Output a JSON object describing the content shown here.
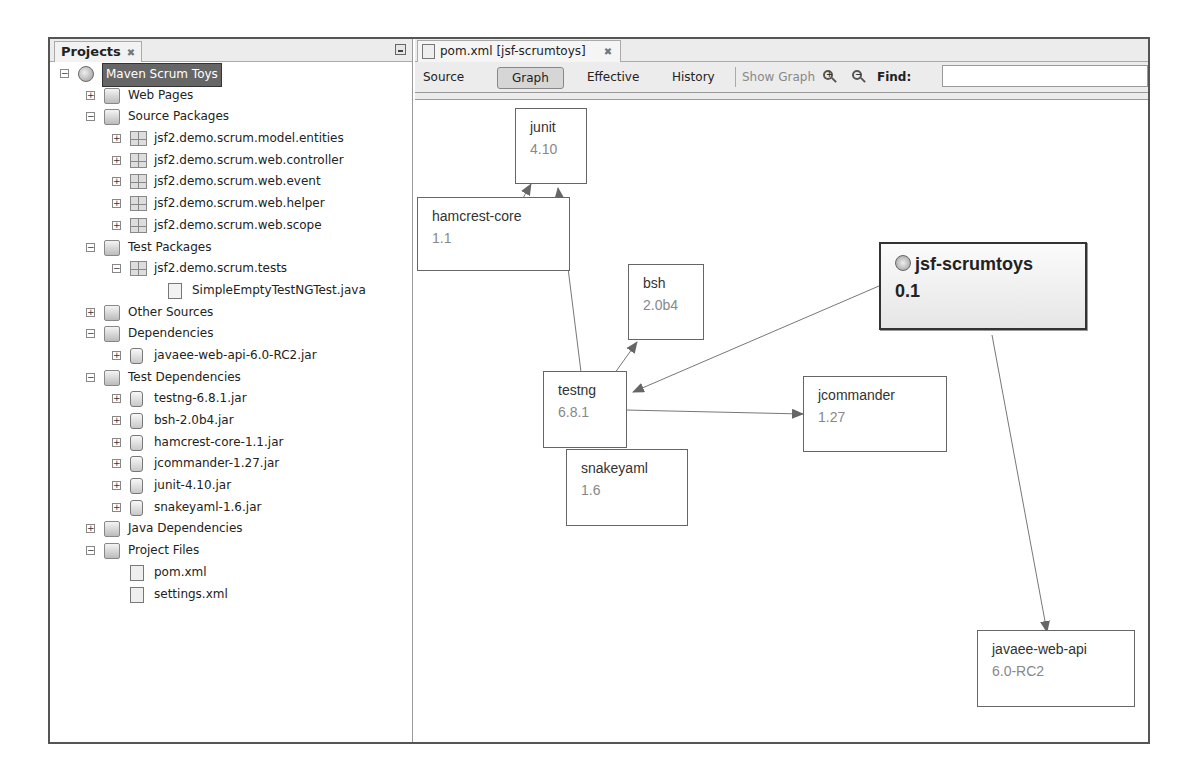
{
  "projects_panel": {
    "title": "Projects",
    "close_glyph": "✖",
    "tree": [
      {
        "label": "Maven Scrum Toys",
        "icon": "maven-project-icon",
        "level": 0,
        "toggle": "minus",
        "selected": true
      },
      {
        "label": "Web Pages",
        "icon": "web-pages-folder-icon",
        "level": 1,
        "toggle": "plus"
      },
      {
        "label": "Source Packages",
        "icon": "source-packages-folder-icon",
        "level": 1,
        "toggle": "minus"
      },
      {
        "label": "jsf2.demo.scrum.model.entities",
        "icon": "package-icon",
        "level": 2,
        "toggle": "plus"
      },
      {
        "label": "jsf2.demo.scrum.web.controller",
        "icon": "package-icon",
        "level": 2,
        "toggle": "plus"
      },
      {
        "label": "jsf2.demo.scrum.web.event",
        "icon": "package-icon",
        "level": 2,
        "toggle": "plus"
      },
      {
        "label": "jsf2.demo.scrum.web.helper",
        "icon": "package-icon",
        "level": 2,
        "toggle": "plus"
      },
      {
        "label": "jsf2.demo.scrum.web.scope",
        "icon": "package-icon",
        "level": 2,
        "toggle": "plus"
      },
      {
        "label": "Test Packages",
        "icon": "test-packages-folder-icon",
        "level": 1,
        "toggle": "minus"
      },
      {
        "label": "jsf2.demo.scrum.tests",
        "icon": "package-icon",
        "level": 2,
        "toggle": "minus"
      },
      {
        "label": "SimpleEmptyTestNGTest.java",
        "icon": "java-file-icon",
        "level": 3,
        "toggle": "none"
      },
      {
        "label": "Other Sources",
        "icon": "other-sources-folder-icon",
        "level": 1,
        "toggle": "plus"
      },
      {
        "label": "Dependencies",
        "icon": "dependencies-folder-icon",
        "level": 1,
        "toggle": "minus"
      },
      {
        "label": "javaee-web-api-6.0-RC2.jar",
        "icon": "jar-icon",
        "level": 2,
        "toggle": "plus"
      },
      {
        "label": "Test Dependencies",
        "icon": "test-dependencies-folder-icon",
        "level": 1,
        "toggle": "minus"
      },
      {
        "label": "testng-6.8.1.jar",
        "icon": "jar-icon",
        "level": 2,
        "toggle": "plus"
      },
      {
        "label": "bsh-2.0b4.jar",
        "icon": "jar-icon",
        "level": 2,
        "toggle": "plus"
      },
      {
        "label": "hamcrest-core-1.1.jar",
        "icon": "jar-icon",
        "level": 2,
        "toggle": "plus"
      },
      {
        "label": "jcommander-1.27.jar",
        "icon": "jar-icon",
        "level": 2,
        "toggle": "plus"
      },
      {
        "label": "junit-4.10.jar",
        "icon": "jar-icon",
        "level": 2,
        "toggle": "plus"
      },
      {
        "label": "snakeyaml-1.6.jar",
        "icon": "jar-icon",
        "level": 2,
        "toggle": "plus"
      },
      {
        "label": "Java Dependencies",
        "icon": "java-dependencies-folder-icon",
        "level": 1,
        "toggle": "plus"
      },
      {
        "label": "Project Files",
        "icon": "project-files-folder-icon",
        "level": 1,
        "toggle": "minus"
      },
      {
        "label": "pom.xml",
        "icon": "xml-file-icon",
        "level": 2,
        "toggle": "none"
      },
      {
        "label": "settings.xml",
        "icon": "xml-file-icon",
        "level": 2,
        "toggle": "none"
      }
    ]
  },
  "editor": {
    "tab_label": "pom.xml [jsf-scrumtoys]",
    "tab_close_glyph": "✖",
    "toolbar": {
      "source": "Source",
      "graph": "Graph",
      "effective": "Effective",
      "history": "History",
      "show_graph": "Show Graph",
      "zoom_in": "+",
      "zoom_out": "−",
      "find_label": "Find:",
      "find_value": ""
    },
    "graph": {
      "nodes": [
        {
          "id": "junit",
          "name": "junit",
          "version": "4.10"
        },
        {
          "id": "hamcrest",
          "name": "hamcrest-core",
          "version": "1.1"
        },
        {
          "id": "bsh",
          "name": "bsh",
          "version": "2.0b4"
        },
        {
          "id": "root",
          "name": "jsf-scrumtoys",
          "version": "0.1"
        },
        {
          "id": "testng",
          "name": "testng",
          "version": "6.8.1"
        },
        {
          "id": "jcommander",
          "name": "jcommander",
          "version": "1.27"
        },
        {
          "id": "snakeyaml",
          "name": "snakeyaml",
          "version": "1.6"
        },
        {
          "id": "javaee",
          "name": "javaee-web-api",
          "version": "6.0-RC2"
        }
      ],
      "edges": [
        {
          "from": "root",
          "to": "testng"
        },
        {
          "from": "root",
          "to": "javaee"
        },
        {
          "from": "testng",
          "to": "bsh"
        },
        {
          "from": "testng",
          "to": "jcommander"
        },
        {
          "from": "testng",
          "to": "junit"
        },
        {
          "from": "hamcrest",
          "to": "junit"
        }
      ]
    }
  }
}
